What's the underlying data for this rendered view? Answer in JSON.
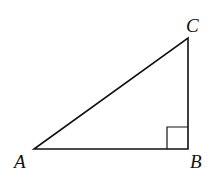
{
  "diagram": {
    "type": "right-triangle",
    "stroke_color": "#111111",
    "background": "#ffffff",
    "vertices": [
      {
        "label": "A",
        "x": 34,
        "y": 149
      },
      {
        "label": "B",
        "x": 188,
        "y": 149
      },
      {
        "label": "C",
        "x": 188,
        "y": 38
      }
    ],
    "right_angle_at": "B",
    "labels": {
      "a": "A",
      "b": "B",
      "c": "C"
    }
  }
}
